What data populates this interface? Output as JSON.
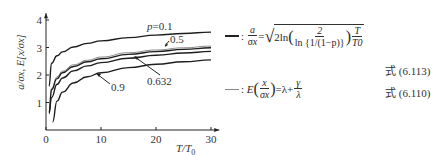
{
  "chart_data": {
    "type": "line",
    "title": "",
    "xlabel": "T/T0",
    "ylabel": "a/σx, E[x/σx]",
    "xlim": [
      0,
      30
    ],
    "ylim": [
      0,
      4
    ],
    "xticks": [
      0,
      10,
      20,
      30
    ],
    "yticks": [
      1,
      2,
      3,
      4
    ],
    "grid": false,
    "x": [
      1,
      2,
      3,
      5,
      7.5,
      10,
      15,
      20,
      25,
      30
    ],
    "series": [
      {
        "name": "p=0.1",
        "label": "p=0.1",
        "style": "dark",
        "values": [
          2.43,
          2.7,
          2.84,
          3.02,
          3.15,
          3.24,
          3.36,
          3.45,
          3.51,
          3.56
        ]
      },
      {
        "name": "E(x/σx)",
        "label": "",
        "style": "light",
        "values": [
          1.52,
          1.93,
          2.14,
          2.37,
          2.54,
          2.65,
          2.81,
          2.91,
          2.99,
          3.05
        ]
      },
      {
        "name": "p=0.5",
        "label": "0.5",
        "style": "dark",
        "values": [
          1.46,
          1.87,
          2.08,
          2.31,
          2.48,
          2.59,
          2.75,
          2.85,
          2.93,
          2.99
        ]
      },
      {
        "name": "p=0.632",
        "label": "0.632",
        "style": "dark",
        "values": [
          1.18,
          1.66,
          1.89,
          2.15,
          2.33,
          2.45,
          2.61,
          2.72,
          2.8,
          2.86
        ]
      },
      {
        "name": "p=0.9",
        "label": "0.9",
        "style": "dark",
        "x_start": 1.2,
        "values": [
          0.29,
          1.05,
          1.38,
          1.71,
          1.94,
          2.08,
          2.27,
          2.39,
          2.48,
          2.55
        ]
      }
    ],
    "annotations": [
      "p=0.1",
      "0.5",
      "0.632",
      "0.9"
    ],
    "legend_position": "right"
  },
  "axis": {
    "xlabel_T": "T",
    "xlabel_sep": "/",
    "xlabel_T0": "T",
    "xlabel_sub": "0",
    "ylabel": "a/σx, E[x/σx]",
    "xtick_labels": [
      "0",
      "10",
      "20",
      "30"
    ],
    "ytick_labels": [
      "1",
      "2",
      "3",
      "4"
    ]
  },
  "labels": {
    "p01": "p=0.1",
    "p05": "0.5",
    "p0632": "0.632",
    "p09": "0.9"
  },
  "legend": {
    "item1": {
      "sep": ":",
      "lhs_num": "a",
      "lhs_den": "σx",
      "eq": "=",
      "coef": "2ln",
      "inner_num": "2",
      "inner_den": "ln {1/(1−p)}",
      "t_num": "T",
      "t_den": "T0",
      "ref": "式 (6.113)"
    },
    "item2": {
      "sep": ":",
      "func": "E",
      "frac_num": "x",
      "frac_den": "σx",
      "eq": "=λ+",
      "g_num": "γ",
      "g_den": "λ",
      "ref": "式 (6.110)"
    }
  }
}
